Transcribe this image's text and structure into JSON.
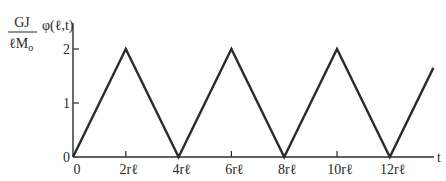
{
  "chart_data": {
    "type": "line",
    "title": "",
    "ylabel_fraction": {
      "numerator": "GJ",
      "denominator": "ℓM",
      "denominator_sub": "o"
    },
    "ylabel_func": "φ(ℓ,t)",
    "xlabel": "t",
    "x_unit": "rℓ",
    "xlim": [
      0,
      14
    ],
    "ylim": [
      0,
      2.5
    ],
    "yticks": [
      0,
      1,
      2
    ],
    "ytick_labels": [
      "0",
      "1",
      "2"
    ],
    "xticks": [
      0,
      2,
      4,
      6,
      8,
      10,
      12
    ],
    "xtick_labels": [
      "0",
      "2rℓ",
      "4rℓ",
      "6rℓ",
      "8rℓ",
      "10rℓ",
      "12rℓ"
    ],
    "grid": false,
    "legend": "none",
    "series": [
      {
        "name": "φ(ℓ,t)",
        "x": [
          0,
          2,
          4,
          6,
          8,
          10,
          12,
          13.65
        ],
        "y": [
          0,
          2,
          0,
          2,
          0,
          2,
          0,
          1.65
        ]
      }
    ]
  }
}
